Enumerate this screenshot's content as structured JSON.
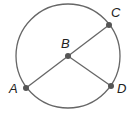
{
  "diagram": {
    "type": "circle-geometry",
    "circle": {
      "cx": 68,
      "cy": 56,
      "r": 52,
      "stroke": "#666666"
    },
    "points": [
      {
        "id": "A",
        "label": "A",
        "x": 26,
        "y": 88,
        "label_x": 9,
        "label_y": 93
      },
      {
        "id": "B",
        "label": "B",
        "x": 68,
        "y": 56,
        "label_x": 61,
        "label_y": 48
      },
      {
        "id": "C",
        "label": "C",
        "x": 109,
        "y": 25,
        "label_x": 111,
        "label_y": 17
      },
      {
        "id": "D",
        "label": "D",
        "x": 111,
        "y": 86,
        "label_x": 117,
        "label_y": 93
      }
    ],
    "segments": [
      {
        "from": "A",
        "to": "C",
        "name": "diameter-AC"
      },
      {
        "from": "B",
        "to": "D",
        "name": "radius-BD"
      }
    ],
    "colors": {
      "line": "#666666",
      "point": "#555555",
      "label": "#222222"
    }
  }
}
